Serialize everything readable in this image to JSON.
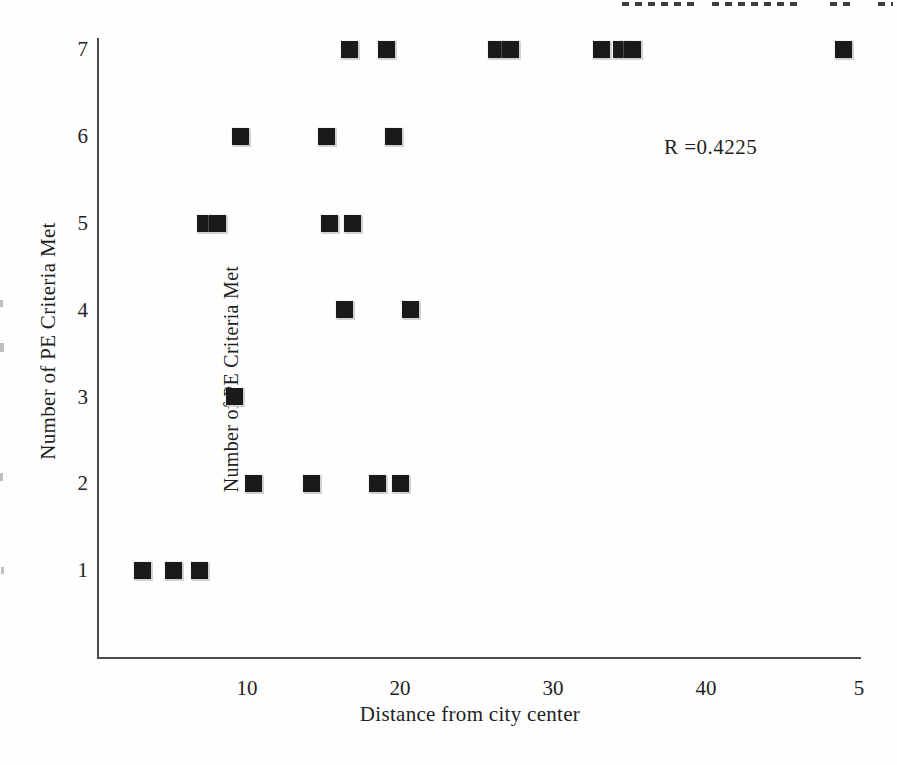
{
  "page": {
    "background_color": "#fefefe",
    "text_color": "#1f1f1f"
  },
  "chart_data": {
    "type": "scatter",
    "title": "",
    "xlabel": "Distance from city center",
    "ylabel": "Number of PE Criteria Met",
    "inner_ylabel_duplicate": "Number of PE Criteria Met",
    "annotation": {
      "text": "R =0.4225"
    },
    "xlim": [
      0,
      50
    ],
    "ylim": [
      0,
      7.5
    ],
    "xtick_values": [
      10,
      20,
      30,
      40,
      50
    ],
    "xtick_labels": [
      "10",
      "20",
      "30",
      "40",
      "5"
    ],
    "xtick_note": "last label '50' clipped by page edge, only '5' visible",
    "ytick_values": [
      7,
      6,
      5,
      4,
      3,
      2,
      1
    ],
    "ytick_labels": [
      "7",
      "6",
      "5",
      "4",
      "3",
      "2",
      "1"
    ],
    "grid": false,
    "legend": null,
    "marker": {
      "shape": "filled-square",
      "color": "#1a1a1a",
      "size_px": 17
    },
    "axis_color": "#4d4d4d",
    "points": [
      {
        "x": 16.7,
        "y": 7
      },
      {
        "x": 19.1,
        "y": 7
      },
      {
        "x": 26.3,
        "y": 7
      },
      {
        "x": 27.2,
        "y": 7
      },
      {
        "x": 33.2,
        "y": 7
      },
      {
        "x": 34.5,
        "y": 7
      },
      {
        "x": 35.2,
        "y": 7
      },
      {
        "x": 49.0,
        "y": 7
      },
      {
        "x": 9.6,
        "y": 6
      },
      {
        "x": 15.2,
        "y": 6
      },
      {
        "x": 19.6,
        "y": 6
      },
      {
        "x": 7.3,
        "y": 5
      },
      {
        "x": 8.1,
        "y": 5
      },
      {
        "x": 15.4,
        "y": 5
      },
      {
        "x": 16.9,
        "y": 5
      },
      {
        "x": 16.4,
        "y": 4
      },
      {
        "x": 20.7,
        "y": 4
      },
      {
        "x": 9.2,
        "y": 3
      },
      {
        "x": 10.4,
        "y": 2
      },
      {
        "x": 14.2,
        "y": 2
      },
      {
        "x": 18.5,
        "y": 2
      },
      {
        "x": 20.0,
        "y": 2
      },
      {
        "x": 3.2,
        "y": 1
      },
      {
        "x": 5.2,
        "y": 1
      },
      {
        "x": 6.9,
        "y": 1
      }
    ]
  }
}
